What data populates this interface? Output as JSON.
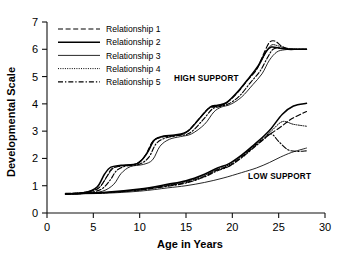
{
  "chart_data": {
    "type": "line",
    "title": "",
    "xlabel": "Age in Years",
    "ylabel": "Developmental Scale",
    "xlim": [
      0,
      30
    ],
    "ylim": [
      0,
      7
    ],
    "xticks": [
      0,
      5,
      10,
      15,
      20,
      25,
      30
    ],
    "yticks": [
      0,
      1,
      2,
      3,
      4,
      5,
      6,
      7
    ],
    "grid": false,
    "legend_position": "top-left",
    "legend_entries": [
      {
        "label": "Relationship 1",
        "style": "dashed"
      },
      {
        "label": "Relationship 2",
        "style": "solid-thick"
      },
      {
        "label": "Relationship 3",
        "style": "solid-thin"
      },
      {
        "label": "Relationship 4",
        "style": "dotted"
      },
      {
        "label": "Relationship 5",
        "style": "dash-dot"
      }
    ],
    "annotations": [
      {
        "text": "HIGH SUPPORT",
        "x": 17.2,
        "y": 4.85
      },
      {
        "text": "LOW SUPPORT",
        "x": 25.1,
        "y": 1.25
      }
    ],
    "groups": [
      {
        "name": "HIGH SUPPORT",
        "series": [
          {
            "name": "Relationship 1",
            "style": "dashed",
            "x": [
              2.0,
              4.0,
              5.5,
              6.4,
              7.0,
              8.0,
              9.6,
              10.6,
              11.4,
              12.4,
              13.6,
              15.0,
              16.4,
              17.4,
              18.2,
              19.2,
              20.4,
              21.6,
              22.6,
              23.4,
              24.0,
              24.6,
              25.4,
              26.4,
              28.0
            ],
            "y": [
              0.72,
              0.75,
              0.9,
              1.3,
              1.62,
              1.72,
              1.8,
              2.1,
              2.62,
              2.78,
              2.82,
              2.95,
              3.45,
              3.82,
              3.9,
              4.0,
              4.35,
              4.85,
              5.25,
              5.85,
              6.25,
              6.3,
              6.1,
              6.0,
              6.0
            ]
          },
          {
            "name": "Relationship 2",
            "style": "solid-thick",
            "x": [
              2.0,
              4.0,
              5.4,
              6.2,
              6.9,
              8.0,
              9.8,
              10.8,
              11.6,
              12.6,
              13.8,
              15.2,
              16.6,
              17.6,
              18.4,
              19.4,
              20.6,
              21.8,
              22.8,
              23.6,
              24.2,
              25.0,
              26.0,
              27.0,
              28.0
            ],
            "y": [
              0.7,
              0.74,
              0.95,
              1.42,
              1.68,
              1.75,
              1.82,
              2.2,
              2.68,
              2.82,
              2.86,
              3.0,
              3.52,
              3.88,
              3.95,
              4.05,
              4.45,
              4.95,
              5.4,
              5.9,
              6.08,
              6.05,
              6.0,
              6.0,
              6.0
            ]
          },
          {
            "name": "Relationship 3",
            "style": "solid-thin",
            "x": [
              2.0,
              4.2,
              6.0,
              7.2,
              8.0,
              9.0,
              10.4,
              11.4,
              12.2,
              13.2,
              14.4,
              15.6,
              17.0,
              18.0,
              18.8,
              19.8,
              21.0,
              22.2,
              23.2,
              24.0,
              24.8,
              25.6,
              26.6,
              28.0
            ],
            "y": [
              0.7,
              0.72,
              0.8,
              1.05,
              1.45,
              1.7,
              1.78,
              1.95,
              2.45,
              2.7,
              2.8,
              2.9,
              3.25,
              3.7,
              3.88,
              3.98,
              4.25,
              4.7,
              5.1,
              5.6,
              5.9,
              5.98,
              6.0,
              6.0
            ]
          },
          {
            "name": "Relationship 4",
            "style": "dotted",
            "x": [
              2.0,
              4.0,
              5.6,
              6.5,
              7.2,
              8.2,
              9.7,
              10.7,
              11.5,
              12.5,
              13.7,
              15.1,
              16.5,
              17.5,
              18.3,
              19.3,
              20.5,
              21.7,
              22.7,
              23.5,
              24.2,
              25.0,
              26.2,
              28.0
            ],
            "y": [
              0.71,
              0.76,
              0.92,
              1.35,
              1.65,
              1.74,
              1.81,
              2.15,
              2.65,
              2.8,
              2.84,
              2.97,
              3.48,
              3.85,
              3.92,
              4.02,
              4.4,
              4.9,
              5.3,
              5.8,
              6.15,
              6.12,
              6.02,
              6.0
            ]
          },
          {
            "name": "Relationship 5",
            "style": "dash-dot",
            "x": [
              2.0,
              4.1,
              5.8,
              6.8,
              7.5,
              8.5,
              10.0,
              11.0,
              11.8,
              12.8,
              14.0,
              15.4,
              16.8,
              17.8,
              18.6,
              19.6,
              20.8,
              22.0,
              23.0,
              23.8,
              24.4,
              25.2,
              26.4,
              28.0
            ],
            "y": [
              0.7,
              0.73,
              0.86,
              1.2,
              1.55,
              1.72,
              1.79,
              2.05,
              2.55,
              2.75,
              2.83,
              2.93,
              3.4,
              3.8,
              3.9,
              4.0,
              4.3,
              4.8,
              5.2,
              5.7,
              6.0,
              6.05,
              6.0,
              6.0
            ]
          }
        ]
      },
      {
        "name": "LOW SUPPORT",
        "series": [
          {
            "name": "Relationship 1",
            "style": "dashed",
            "x": [
              2.0,
              6.0,
              10.0,
              13.0,
              15.0,
              17.0,
              18.4,
              19.6,
              21.0,
              22.4,
              23.4,
              24.2,
              25.2,
              26.4,
              28.0
            ],
            "y": [
              0.7,
              0.74,
              0.85,
              1.0,
              1.12,
              1.35,
              1.58,
              1.72,
              2.05,
              2.45,
              2.72,
              2.92,
              3.15,
              3.45,
              3.72
            ]
          },
          {
            "name": "Relationship 2",
            "style": "solid-thick",
            "x": [
              2.0,
              6.0,
              10.0,
              13.0,
              15.0,
              17.0,
              18.4,
              19.6,
              21.0,
              22.4,
              23.4,
              24.2,
              25.4,
              26.6,
              28.0
            ],
            "y": [
              0.7,
              0.75,
              0.88,
              1.05,
              1.18,
              1.42,
              1.65,
              1.8,
              2.12,
              2.52,
              2.82,
              3.1,
              3.62,
              3.92,
              4.02
            ]
          },
          {
            "name": "Relationship 3",
            "style": "solid-thin",
            "x": [
              2.0,
              6.0,
              10.0,
              13.0,
              15.0,
              17.0,
              19.0,
              21.0,
              22.6,
              24.0,
              25.2,
              26.4,
              28.0
            ],
            "y": [
              0.7,
              0.72,
              0.8,
              0.92,
              1.0,
              1.12,
              1.28,
              1.48,
              1.65,
              1.85,
              2.05,
              2.22,
              2.38
            ]
          },
          {
            "name": "Relationship 4",
            "style": "dotted",
            "x": [
              2.0,
              6.0,
              10.0,
              13.0,
              15.0,
              17.0,
              18.4,
              19.6,
              21.0,
              22.4,
              23.4,
              24.2,
              25.4,
              26.6,
              28.0
            ],
            "y": [
              0.7,
              0.74,
              0.86,
              1.02,
              1.15,
              1.38,
              1.6,
              1.76,
              2.08,
              2.48,
              2.76,
              3.0,
              3.35,
              3.25,
              3.18
            ]
          },
          {
            "name": "Relationship 5",
            "style": "dash-dot",
            "x": [
              2.0,
              6.0,
              10.0,
              13.0,
              15.0,
              17.0,
              18.4,
              19.6,
              21.0,
              22.4,
              23.4,
              24.2,
              25.0,
              26.0,
              27.0,
              28.0
            ],
            "y": [
              0.7,
              0.74,
              0.84,
              0.98,
              1.1,
              1.32,
              1.55,
              1.7,
              2.02,
              2.42,
              2.7,
              2.9,
              2.62,
              2.32,
              2.26,
              2.28
            ]
          }
        ]
      }
    ]
  }
}
